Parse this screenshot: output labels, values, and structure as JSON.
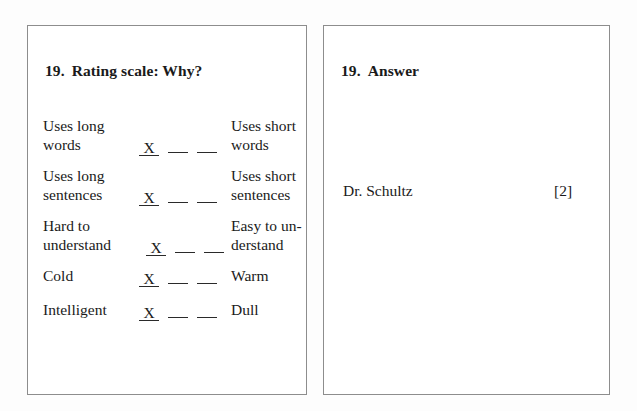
{
  "question_panel": {
    "heading_number": "19.",
    "heading_text": "Rating scale: Why?",
    "scale_rows": [
      {
        "left_lines": [
          "Uses long",
          "words"
        ],
        "right_lines": [
          "Uses short",
          "words"
        ],
        "marks": [
          "X",
          "",
          ""
        ],
        "selected_index": 0
      },
      {
        "left_lines": [
          "Uses long",
          "sentences"
        ],
        "right_lines": [
          "Uses short",
          "sentences"
        ],
        "marks": [
          "X",
          "",
          ""
        ],
        "selected_index": 0
      },
      {
        "left_lines": [
          "Hard to",
          "understand"
        ],
        "right_lines": [
          "Easy to un-",
          "derstand"
        ],
        "marks": [
          "X",
          "",
          ""
        ],
        "selected_index": 0
      },
      {
        "left_lines": [
          "Cold"
        ],
        "right_lines": [
          "Warm"
        ],
        "marks": [
          "X",
          "",
          ""
        ],
        "selected_index": 0
      },
      {
        "left_lines": [
          "Intelligent"
        ],
        "right_lines": [
          "Dull"
        ],
        "marks": [
          "X",
          "",
          ""
        ],
        "selected_index": 0
      }
    ]
  },
  "answer_panel": {
    "heading_number": "19.",
    "heading_text": "Answer",
    "answer_text": "Dr. Schultz",
    "marks": "[2]"
  },
  "colors": {
    "page_background": "#fdfdfd",
    "panel_background": "#ffffff",
    "panel_border": "#8d8d8d",
    "text": "#1a1a1a",
    "rule": "#2a2a2a"
  }
}
